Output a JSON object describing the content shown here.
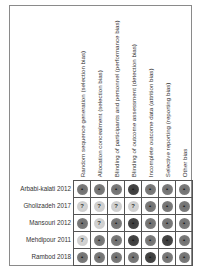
{
  "chart_data": {
    "type": "table",
    "columns": [
      "Random sequence generation (selection bias)",
      "Allocation concealment (selection bias)",
      "Blinding of participants and personnel (performance bias)",
      "Blinding of outcome assessment (detection bias)",
      "Incomplete outcome data (attrition bias)",
      "Selective reporting (reporting bias)",
      "Other bias"
    ],
    "rows": [
      {
        "study": "Arbabi-kalati 2012",
        "ratings": [
          "low",
          "low",
          "low",
          "high",
          "low",
          "low",
          "low"
        ]
      },
      {
        "study": "Gholizadeh 2017",
        "ratings": [
          "unclear",
          "unclear",
          "unclear",
          "unclear",
          "low",
          "low",
          "low"
        ]
      },
      {
        "study": "Mansouri 2012",
        "ratings": [
          "low",
          "unclear",
          "low",
          "high",
          "low",
          "low",
          "low"
        ]
      },
      {
        "study": "Mehdipour 2011",
        "ratings": [
          "unclear",
          "low",
          "low",
          "high",
          "low",
          "high",
          "low"
        ]
      },
      {
        "study": "Rambod 2018",
        "ratings": [
          "low",
          "low",
          "low",
          "low",
          "high",
          "low",
          "low"
        ]
      }
    ],
    "legend": {
      "low": "+",
      "high": "-",
      "unclear": "?"
    },
    "colors": {
      "low": "#777777",
      "high": "#444444",
      "unclear": "#d0d0d0"
    }
  }
}
